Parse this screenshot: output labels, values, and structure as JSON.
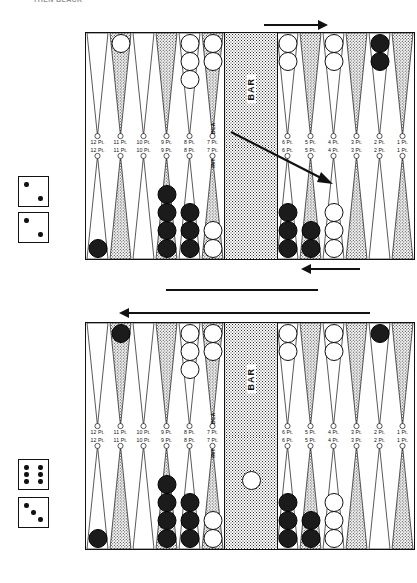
{
  "page": {
    "header": "THEN BLACK"
  },
  "labels": {
    "bar": "BAR",
    "point_suffix": "Pt.",
    "point_numbers_left": [
      "12",
      "11",
      "10",
      "9",
      "8",
      "7"
    ],
    "point_numbers_right": [
      "6",
      "5",
      "4",
      "3",
      "2",
      "1"
    ],
    "vertical_text_top": "BLA",
    "vertical_text_bottom": "INT"
  },
  "boards": [
    {
      "name": "top-board",
      "top_row": {
        "left": [
          {
            "point": "12 Pt.",
            "checkers": 0,
            "color": "none"
          },
          {
            "point": "11 Pt.",
            "checkers": 1,
            "color": "white"
          },
          {
            "point": "10 Pt.",
            "checkers": 0,
            "color": "none"
          },
          {
            "point": "9 Pt.",
            "checkers": 0,
            "color": "none"
          },
          {
            "point": "8 Pt.",
            "checkers": 3,
            "color": "white"
          },
          {
            "point": "7 Pt.",
            "checkers": 2,
            "color": "white"
          }
        ],
        "right": [
          {
            "point": "6 Pt.",
            "checkers": 2,
            "color": "white"
          },
          {
            "point": "5 Pt.",
            "checkers": 0,
            "color": "none"
          },
          {
            "point": "4 Pt.",
            "checkers": 2,
            "color": "white"
          },
          {
            "point": "3 Pt.",
            "checkers": 0,
            "color": "none"
          },
          {
            "point": "2 Pt.",
            "checkers": 2,
            "color": "black"
          },
          {
            "point": "1 Pt.",
            "checkers": 0,
            "color": "none"
          }
        ]
      },
      "bottom_row": {
        "left": [
          {
            "point": "12 Pt.",
            "checkers": 1,
            "color": "black"
          },
          {
            "point": "11 Pt.",
            "checkers": 0,
            "color": "none"
          },
          {
            "point": "10 Pt.",
            "checkers": 0,
            "color": "none"
          },
          {
            "point": "9 Pt.",
            "checkers": 4,
            "color": "black"
          },
          {
            "point": "8 Pt.",
            "checkers": 3,
            "color": "black"
          },
          {
            "point": "7 Pt.",
            "checkers": 2,
            "color": "white"
          }
        ],
        "right": [
          {
            "point": "6 Pt.",
            "checkers": 3,
            "color": "black"
          },
          {
            "point": "5 Pt.",
            "checkers": 2,
            "color": "black"
          },
          {
            "point": "4 Pt.",
            "checkers": 3,
            "color": "white"
          },
          {
            "point": "3 Pt.",
            "checkers": 0,
            "color": "none"
          },
          {
            "point": "2 Pt.",
            "checkers": 0,
            "color": "none"
          },
          {
            "point": "1 Pt.",
            "checkers": 0,
            "color": "none"
          }
        ]
      },
      "bar_checkers": {
        "count": 0,
        "color": "none"
      },
      "dice": [
        {
          "name": "die-a",
          "value": 2
        },
        {
          "name": "die-b",
          "value": 2
        }
      ]
    },
    {
      "name": "bottom-board",
      "top_row": {
        "left": [
          {
            "point": "12 Pt.",
            "checkers": 0,
            "color": "none"
          },
          {
            "point": "11 Pt.",
            "checkers": 1,
            "color": "black"
          },
          {
            "point": "10 Pt.",
            "checkers": 0,
            "color": "none"
          },
          {
            "point": "9 Pt.",
            "checkers": 0,
            "color": "none"
          },
          {
            "point": "8 Pt.",
            "checkers": 3,
            "color": "white"
          },
          {
            "point": "7 Pt.",
            "checkers": 2,
            "color": "white"
          }
        ],
        "right": [
          {
            "point": "6 Pt.",
            "checkers": 2,
            "color": "white"
          },
          {
            "point": "5 Pt.",
            "checkers": 0,
            "color": "none"
          },
          {
            "point": "4 Pt.",
            "checkers": 2,
            "color": "white"
          },
          {
            "point": "3 Pt.",
            "checkers": 0,
            "color": "none"
          },
          {
            "point": "2 Pt.",
            "checkers": 1,
            "color": "black"
          },
          {
            "point": "1 Pt.",
            "checkers": 0,
            "color": "none"
          }
        ]
      },
      "bottom_row": {
        "left": [
          {
            "point": "12 Pt.",
            "checkers": 1,
            "color": "black"
          },
          {
            "point": "11 Pt.",
            "checkers": 0,
            "color": "none"
          },
          {
            "point": "10 Pt.",
            "checkers": 0,
            "color": "none"
          },
          {
            "point": "9 Pt.",
            "checkers": 4,
            "color": "black"
          },
          {
            "point": "8 Pt.",
            "checkers": 3,
            "color": "black"
          },
          {
            "point": "7 Pt.",
            "checkers": 2,
            "color": "white"
          }
        ],
        "right": [
          {
            "point": "6 Pt.",
            "checkers": 3,
            "color": "black"
          },
          {
            "point": "5 Pt.",
            "checkers": 2,
            "color": "black"
          },
          {
            "point": "4 Pt.",
            "checkers": 3,
            "color": "white"
          },
          {
            "point": "3 Pt.",
            "checkers": 0,
            "color": "none"
          },
          {
            "point": "2 Pt.",
            "checkers": 0,
            "color": "none"
          },
          {
            "point": "1 Pt.",
            "checkers": 0,
            "color": "none"
          }
        ]
      },
      "bar_checkers": {
        "count": 1,
        "color": "white"
      },
      "dice": [
        {
          "name": "die-c",
          "value": 6
        },
        {
          "name": "die-d",
          "value": 3
        }
      ]
    }
  ],
  "colors": {
    "ink": "#111111",
    "white_checker": "#ffffff",
    "black_checker": "#1b1b1b",
    "paper": "#ffffff"
  }
}
